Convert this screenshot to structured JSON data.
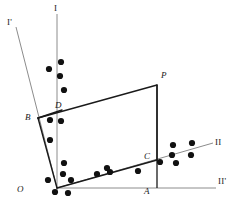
{
  "figure": {
    "background_color": "#ffffff",
    "axis_color": "#8c8c8c",
    "line_color": "#1a1a1a",
    "point_color": "#111111"
  },
  "axis_labels": [
    {
      "id": "axis-I",
      "text": "I",
      "x": 54,
      "y": 4
    },
    {
      "id": "axis-I-prime",
      "text": "I'",
      "x": 7,
      "y": 18
    },
    {
      "id": "axis-II",
      "text": "II",
      "x": 215,
      "y": 138
    },
    {
      "id": "axis-II-prime",
      "text": "II'",
      "x": 218,
      "y": 177
    }
  ],
  "point_labels": [
    {
      "id": "label-O",
      "text": "O",
      "x": 17,
      "y": 185
    },
    {
      "id": "label-A",
      "text": "A",
      "x": 144,
      "y": 187
    },
    {
      "id": "label-B",
      "text": "B",
      "x": 25,
      "y": 113
    },
    {
      "id": "label-C",
      "text": "C",
      "x": 144,
      "y": 152
    },
    {
      "id": "label-D",
      "text": "D",
      "x": 55,
      "y": 101
    },
    {
      "id": "label-P",
      "text": "P",
      "x": 161,
      "y": 71
    }
  ],
  "axes": [
    {
      "id": "axis-line-I",
      "x1": 57,
      "y1": 14,
      "x2": 57,
      "y2": 190
    },
    {
      "id": "axis-line-I-prime",
      "x1": 16,
      "y1": 27,
      "x2": 57,
      "y2": 188
    },
    {
      "id": "axis-line-II",
      "x1": 57,
      "y1": 188,
      "x2": 213,
      "y2": 143
    },
    {
      "id": "axis-line-II-prime",
      "x1": 57,
      "y1": 188,
      "x2": 216,
      "y2": 188
    }
  ],
  "polygon": {
    "id": "construction-quadrilateral",
    "vertices": [
      {
        "name": "O",
        "x": 57,
        "y": 188
      },
      {
        "name": "B",
        "x": 38,
        "y": 118
      },
      {
        "name": "D",
        "x": 62,
        "y": 110
      },
      {
        "name": "P",
        "x": 157,
        "y": 85
      },
      {
        "name": "C",
        "x": 157,
        "y": 160
      }
    ],
    "edges": [
      {
        "from": "O",
        "to": "B"
      },
      {
        "from": "B",
        "to": "D"
      },
      {
        "from": "B",
        "to": "P"
      },
      {
        "from": "P",
        "to": "C"
      },
      {
        "from": "C",
        "to": "O"
      }
    ]
  },
  "drop_lines": [
    {
      "id": "drop-line-P-A",
      "x1": 157,
      "y1": 85,
      "x2": 157,
      "y2": 188
    }
  ],
  "scatter_points": {
    "radius": 3.1,
    "points": [
      {
        "x": 61,
        "y": 62
      },
      {
        "x": 49,
        "y": 69
      },
      {
        "x": 60,
        "y": 76
      },
      {
        "x": 64,
        "y": 90
      },
      {
        "x": 50,
        "y": 120
      },
      {
        "x": 61,
        "y": 121
      },
      {
        "x": 50,
        "y": 140
      },
      {
        "x": 64,
        "y": 163
      },
      {
        "x": 63,
        "y": 174
      },
      {
        "x": 48,
        "y": 180
      },
      {
        "x": 71,
        "y": 180
      },
      {
        "x": 55,
        "y": 192
      },
      {
        "x": 68,
        "y": 193
      },
      {
        "x": 97,
        "y": 174
      },
      {
        "x": 107,
        "y": 168
      },
      {
        "x": 110,
        "y": 172
      },
      {
        "x": 138,
        "y": 171
      },
      {
        "x": 160,
        "y": 162
      },
      {
        "x": 173,
        "y": 145
      },
      {
        "x": 172,
        "y": 155
      },
      {
        "x": 176,
        "y": 163
      },
      {
        "x": 192,
        "y": 143
      },
      {
        "x": 191,
        "y": 155
      }
    ]
  }
}
